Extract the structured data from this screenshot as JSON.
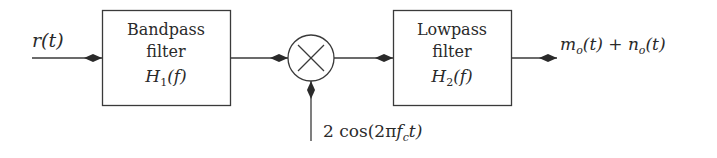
{
  "diagram": {
    "type": "block-diagram",
    "input": {
      "label": "r(t)"
    },
    "blocks": [
      {
        "id": "bandpass",
        "lines": [
          "Bandpass",
          "filter"
        ],
        "transfer": {
          "main": "H",
          "sub": "1",
          "arg": "(f)"
        }
      },
      {
        "id": "mixer",
        "symbol": "×",
        "kind": "multiplier"
      },
      {
        "id": "lowpass",
        "lines": [
          "Lowpass",
          "filter"
        ],
        "transfer": {
          "main": "H",
          "sub": "2",
          "arg": "(f)"
        }
      }
    ],
    "oscillator": {
      "label_prefix": "2 cos(2π",
      "label_f": "f",
      "label_sub": "c",
      "label_suffix": "t)"
    },
    "output": {
      "m": "m",
      "m_sub": "o",
      "m_arg": "(t) + ",
      "n": "n",
      "n_sub": "o",
      "n_arg": "(t)"
    },
    "colors": {
      "line": "#3a3a3a",
      "text": "#2a2a2a",
      "background": "#ffffff"
    }
  }
}
